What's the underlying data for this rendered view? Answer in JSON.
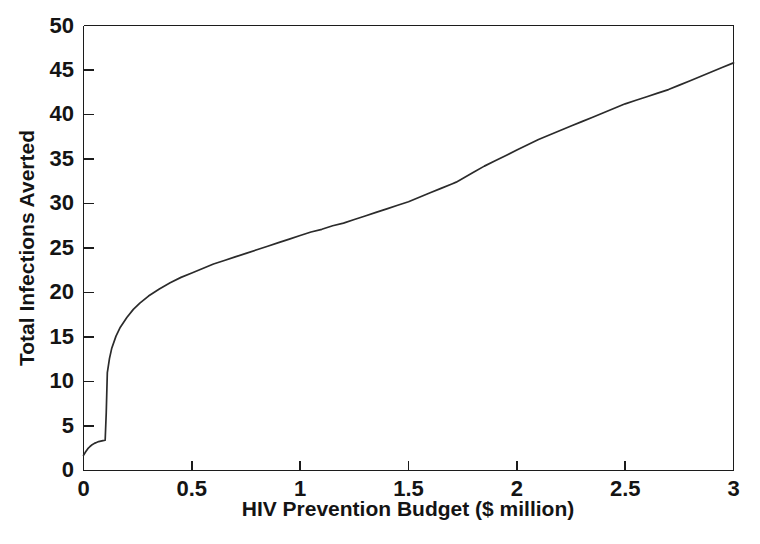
{
  "chart_data": {
    "type": "line",
    "title": "",
    "xlabel": "HIV Prevention Budget ($ million)",
    "ylabel": "Total Infections Averted",
    "xlim": [
      0,
      3
    ],
    "ylim": [
      0,
      50
    ],
    "grid": false,
    "legend": null,
    "x_ticks": [
      "0",
      "0.5",
      "1",
      "1.5",
      "2",
      "2.5",
      "3"
    ],
    "x_tick_values": [
      0,
      0.5,
      1,
      1.5,
      2,
      2.5,
      3
    ],
    "y_ticks": [
      "0",
      "5",
      "10",
      "15",
      "20",
      "25",
      "30",
      "35",
      "40",
      "45",
      "50"
    ],
    "y_tick_values": [
      0,
      5,
      10,
      15,
      20,
      25,
      30,
      35,
      40,
      45,
      50
    ],
    "line_color": "#2b2b2b",
    "axis_color": "#1c1c1c",
    "background_color": "#ffffff",
    "annotations": [
      "Near-vertical jump from about 3.4 to 11 infections averted near a budget of 0.10 million",
      "Slope kink (inflection to a steeper segment) near a budget of 1.72 million at about 32.4 infections averted"
    ],
    "series": [
      {
        "name": "Total Infections Averted",
        "x": [
          0.0,
          0.01,
          0.02,
          0.03,
          0.04,
          0.05,
          0.06,
          0.07,
          0.08,
          0.09,
          0.1,
          0.105,
          0.11,
          0.12,
          0.13,
          0.15,
          0.17,
          0.2,
          0.23,
          0.26,
          0.3,
          0.35,
          0.4,
          0.45,
          0.5,
          0.55,
          0.6,
          0.65,
          0.7,
          0.75,
          0.8,
          0.85,
          0.9,
          0.95,
          1.0,
          1.05,
          1.1,
          1.15,
          1.2,
          1.25,
          1.3,
          1.35,
          1.4,
          1.45,
          1.5,
          1.55,
          1.6,
          1.65,
          1.7,
          1.72,
          1.75,
          1.8,
          1.85,
          1.9,
          1.95,
          2.0,
          2.05,
          2.1,
          2.15,
          2.2,
          2.25,
          2.3,
          2.35,
          2.4,
          2.45,
          2.5,
          2.55,
          2.6,
          2.65,
          2.7,
          2.75,
          2.8,
          2.85,
          2.9,
          2.95,
          3.0
        ],
        "y": [
          1.7,
          2.1,
          2.45,
          2.7,
          2.9,
          3.05,
          3.15,
          3.25,
          3.3,
          3.35,
          3.4,
          6.5,
          11.0,
          12.6,
          13.7,
          15.1,
          16.1,
          17.2,
          18.1,
          18.8,
          19.6,
          20.4,
          21.1,
          21.7,
          22.2,
          22.7,
          23.2,
          23.6,
          24.0,
          24.4,
          24.8,
          25.2,
          25.6,
          26.0,
          26.4,
          26.8,
          27.1,
          27.5,
          27.8,
          28.2,
          28.6,
          29.0,
          29.4,
          29.8,
          30.2,
          30.7,
          31.2,
          31.7,
          32.2,
          32.4,
          32.8,
          33.5,
          34.2,
          34.8,
          35.4,
          36.0,
          36.6,
          37.2,
          37.7,
          38.2,
          38.7,
          39.2,
          39.7,
          40.2,
          40.7,
          41.2,
          41.6,
          42.0,
          42.4,
          42.8,
          43.3,
          43.8,
          44.3,
          44.8,
          45.3,
          45.8
        ]
      }
    ]
  },
  "figure": {
    "y_axis_title": "Total Infections Averted",
    "x_axis_title": "HIV Prevention Budget ($ million)",
    "y_tick_labels": [
      "50",
      "45",
      "40",
      "35",
      "30",
      "25",
      "20",
      "15",
      "10",
      "5",
      "0"
    ],
    "x_tick_labels": [
      "0",
      "0.5",
      "1",
      "1.5",
      "2",
      "2.5",
      "3"
    ]
  }
}
